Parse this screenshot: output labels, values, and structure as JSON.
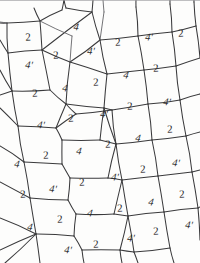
{
  "figure": {
    "kind": "hand-drawn-tiling-diagram",
    "width": 200,
    "height": 263,
    "background_color": "#fdfdfc",
    "ink_color": "#3a3a3c",
    "label_color": "#2e2e30"
  },
  "legend": {
    "symbols": [
      "2",
      "4",
      "4'"
    ],
    "description": "Each quadrilateral cell of the tiling carries one of the labels 2, 4 or 4'."
  },
  "labels": [
    {
      "text": "2",
      "x": 28,
      "y": 38,
      "rot": -3,
      "style": "plain"
    },
    {
      "text": "4",
      "x": 76,
      "y": 28,
      "rot": 6,
      "style": "italic"
    },
    {
      "text": "4'",
      "x": 149,
      "y": 38,
      "rot": 4,
      "style": "italic"
    },
    {
      "text": "2",
      "x": 181,
      "y": 34,
      "rot": -2,
      "style": "plain"
    },
    {
      "text": "4'",
      "x": 29,
      "y": 66,
      "rot": 5,
      "style": "italic"
    },
    {
      "text": "2",
      "x": 56,
      "y": 56,
      "rot": -2,
      "style": "plain"
    },
    {
      "text": "4'",
      "x": 91,
      "y": 52,
      "rot": 4,
      "style": "italic"
    },
    {
      "text": "2",
      "x": 118,
      "y": 43,
      "rot": -2,
      "style": "plain"
    },
    {
      "text": "2",
      "x": 156,
      "y": 69,
      "rot": -2,
      "style": "plain"
    },
    {
      "text": "4",
      "x": 126,
      "y": 76,
      "rot": 8,
      "style": "italic"
    },
    {
      "text": "2",
      "x": 96,
      "y": 83,
      "rot": -2,
      "style": "plain"
    },
    {
      "text": "4",
      "x": 65,
      "y": 89,
      "rot": 7,
      "style": "italic"
    },
    {
      "text": "2",
      "x": 35,
      "y": 94,
      "rot": -2,
      "style": "plain"
    },
    {
      "text": "4'",
      "x": 167,
      "y": 103,
      "rot": 5,
      "style": "italic"
    },
    {
      "text": "2",
      "x": 130,
      "y": 107,
      "rot": -2,
      "style": "plain"
    },
    {
      "text": "4'",
      "x": 104,
      "y": 115,
      "rot": 4,
      "style": "italic"
    },
    {
      "text": "2",
      "x": 71,
      "y": 119,
      "rot": -2,
      "style": "plain"
    },
    {
      "text": "4'",
      "x": 41,
      "y": 126,
      "rot": 5,
      "style": "italic"
    },
    {
      "text": "2",
      "x": 170,
      "y": 130,
      "rot": -2,
      "style": "plain"
    },
    {
      "text": "4",
      "x": 138,
      "y": 139,
      "rot": 8,
      "style": "italic"
    },
    {
      "text": "2",
      "x": 108,
      "y": 145,
      "rot": -2,
      "style": "plain"
    },
    {
      "text": "4",
      "x": 79,
      "y": 152,
      "rot": 7,
      "style": "italic"
    },
    {
      "text": "2",
      "x": 46,
      "y": 156,
      "rot": -2,
      "style": "plain"
    },
    {
      "text": "4",
      "x": 17,
      "y": 165,
      "rot": 7,
      "style": "italic"
    },
    {
      "text": "4'",
      "x": 176,
      "y": 164,
      "rot": 5,
      "style": "italic"
    },
    {
      "text": "2",
      "x": 143,
      "y": 170,
      "rot": -2,
      "style": "plain"
    },
    {
      "text": "4'",
      "x": 115,
      "y": 178,
      "rot": 4,
      "style": "italic"
    },
    {
      "text": "2",
      "x": 82,
      "y": 183,
      "rot": -2,
      "style": "plain"
    },
    {
      "text": "4'",
      "x": 53,
      "y": 190,
      "rot": 5,
      "style": "italic"
    },
    {
      "text": "2",
      "x": 23,
      "y": 195,
      "rot": -2,
      "style": "plain"
    },
    {
      "text": "2",
      "x": 182,
      "y": 195,
      "rot": -2,
      "style": "plain"
    },
    {
      "text": "4",
      "x": 151,
      "y": 203,
      "rot": 8,
      "style": "italic"
    },
    {
      "text": "2",
      "x": 120,
      "y": 209,
      "rot": -2,
      "style": "plain"
    },
    {
      "text": "4",
      "x": 90,
      "y": 214,
      "rot": 7,
      "style": "italic"
    },
    {
      "text": "2",
      "x": 60,
      "y": 220,
      "rot": -2,
      "style": "plain"
    },
    {
      "text": "4",
      "x": 30,
      "y": 228,
      "rot": 7,
      "style": "italic"
    },
    {
      "text": "4'",
      "x": 189,
      "y": 226,
      "rot": 5,
      "style": "italic"
    },
    {
      "text": "2",
      "x": 156,
      "y": 232,
      "rot": -2,
      "style": "plain"
    },
    {
      "text": "4'",
      "x": 131,
      "y": 239,
      "rot": 4,
      "style": "italic"
    },
    {
      "text": "2",
      "x": 96,
      "y": 245,
      "rot": -2,
      "style": "plain"
    },
    {
      "text": "4'",
      "x": 68,
      "y": 251,
      "rot": 5,
      "style": "italic"
    }
  ],
  "edges": [
    "M 7 23 L 40 21",
    "M 40 21 L 62 10",
    "M 40 21 L 42 50",
    "M 42 50 L 8 53",
    "M 8 53 L 7 23",
    "M 0 40 L 8 53",
    "M 42 50 L 92 12",
    "M 92 12 L 66 8",
    "M 92 12 L 100 40",
    "M 100 40 L 70 62",
    "M 70 62 L 42 50",
    "M 8 53 L 12 91",
    "M 12 91 L 50 90",
    "M 50 90 L 42 50",
    "M 0 70 L 12 91",
    "M 100 40 L 138 36",
    "M 138 36 L 136 7",
    "M 138 36 L 144 70",
    "M 144 70 L 107 74",
    "M 107 74 L 100 40",
    "M 138 36 L 172 32",
    "M 172 32 L 170 4",
    "M 172 32 L 176 66",
    "M 176 66 L 144 70",
    "M 172 32 L 196 26",
    "M 196 26 L 194 2",
    "M 196 26 L 200 58",
    "M 200 58 L 176 66",
    "M 70 62 L 107 74",
    "M 107 74 L 104 108",
    "M 104 108 L 66 104",
    "M 66 104 L 70 62",
    "M 50 90 L 66 104",
    "M 12 91 L 18 126",
    "M 18 126 L 56 128",
    "M 56 128 L 66 104",
    "M 0 108 L 18 126",
    "M 144 70 L 148 104",
    "M 148 104 L 112 110",
    "M 112 110 L 104 108",
    "M 176 66 L 180 100",
    "M 180 100 L 148 104",
    "M 180 100 L 200 94",
    "M 148 104 L 152 140",
    "M 152 140 L 116 144",
    "M 116 144 L 112 110",
    "M 104 108 L 116 144",
    "M 56 128 L 62 140",
    "M 62 140 L 100 140",
    "M 100 140 L 116 144",
    "M 100 140 L 104 108",
    "M 18 126 L 24 162",
    "M 24 162 L 62 164",
    "M 62 164 L 62 140",
    "M 0 146 L 24 162",
    "M 180 100 L 186 136",
    "M 186 136 L 152 140",
    "M 186 136 L 200 132",
    "M 152 140 L 158 176",
    "M 158 176 L 122 180",
    "M 122 180 L 116 144",
    "M 62 164 L 70 178",
    "M 70 178 L 108 178",
    "M 108 178 L 122 180",
    "M 108 178 L 116 144",
    "M 24 162 L 30 198",
    "M 30 198 L 68 200",
    "M 68 200 L 70 178",
    "M 0 182 L 30 198",
    "M 186 136 L 192 172",
    "M 192 172 L 158 176",
    "M 192 172 L 200 170",
    "M 158 176 L 164 212",
    "M 164 212 L 128 216",
    "M 128 216 L 122 180",
    "M 68 200 L 76 214",
    "M 76 214 L 114 214",
    "M 114 214 L 128 216",
    "M 114 214 L 122 180",
    "M 30 198 L 36 234",
    "M 36 234 L 74 236",
    "M 74 236 L 76 214",
    "M 0 218 L 36 234",
    "M 192 172 L 198 208",
    "M 198 208 L 164 212",
    "M 198 208 L 200 207",
    "M 164 212 L 170 248",
    "M 170 248 L 134 252",
    "M 134 252 L 128 216",
    "M 74 236 L 82 250",
    "M 82 250 L 120 250",
    "M 120 250 L 134 252",
    "M 120 250 L 128 216",
    "M 36 234 L 40 263",
    "M 82 250 L 84 263",
    "M 120 250 L 122 263",
    "M 134 252 L 138 263",
    "M 170 248 L 174 263",
    "M 198 208 L 200 240",
    "M 0 250 L 36 234",
    "M 5 263 L 36 234",
    "M 62 10 L 64 0",
    "M 66 8 L 64 0",
    "M 92 12 L 93 0",
    "M 136 7 L 136 0",
    "M 170 4 L 170 0",
    "M 194 2 L 194 0",
    "M 40 21 L 34 8",
    "M 0 23 L 7 23",
    "M 112 110 L 76 114",
    "M 76 114 L 66 104",
    "M 56 128 L 76 114",
    "M 200 94 L 200 94",
    "M 0 95 L 12 91"
  ],
  "edges_soft": [
    "M 7 23 L 0 22",
    "M 100 40 L 104 12",
    "M 104 12 L 103 0",
    "M 70 62 L 72 36",
    "M 72 36 L 40 21"
  ]
}
